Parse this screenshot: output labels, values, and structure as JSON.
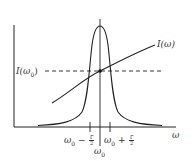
{
  "diagram": {
    "type": "resonance-plot",
    "axes": {
      "x_label": "ω",
      "y_label": ""
    },
    "curves": [
      {
        "name": "resonance-peak",
        "shape": "lorentzian",
        "center": "ω0"
      },
      {
        "name": "intensity-curve",
        "label": "I(ω)",
        "shape": "rising-concave"
      }
    ],
    "reference_line": {
      "label_prefix": "I(",
      "label_sub": "ω",
      "label_sub_index": "0",
      "label_suffix": ")",
      "style": "dashed"
    },
    "curve_label": "I(ω)",
    "tick_labels": {
      "left": {
        "base": "ω",
        "sub": "0",
        "op": " − ",
        "num": "Γ",
        "den": "2"
      },
      "right": {
        "base": "ω",
        "sub": "0",
        "op": " + ",
        "num": "Γ",
        "den": "2"
      },
      "center": {
        "base": "ω",
        "sub": "0"
      }
    },
    "colors": {
      "line": "#222222",
      "text": "#333333",
      "background": "#ffffff"
    }
  }
}
